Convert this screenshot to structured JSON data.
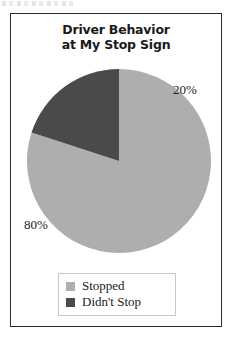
{
  "chart_data": {
    "type": "pie",
    "title": "Driver Behavior at My Stop Sign",
    "title_lines": [
      "Driver Behavior",
      "at My Stop Sign"
    ],
    "categories": [
      "Stopped",
      "Didn't Stop"
    ],
    "values": [
      80,
      20
    ],
    "value_labels": [
      "80%",
      "20%"
    ],
    "unit": "%",
    "colors": [
      "#aeaeae",
      "#4a4a4a"
    ],
    "legend_position": "bottom",
    "start_angle_deg": 0,
    "direction": "clockwise",
    "xlabel": "",
    "ylabel": "",
    "grid": false,
    "slices": [
      {
        "label": "Stopped",
        "value": 80,
        "display": "80%",
        "color": "#aeaeae"
      },
      {
        "label": "Didn't Stop",
        "value": 20,
        "display": "20%",
        "color": "#4a4a4a"
      }
    ]
  },
  "legend": {
    "items": [
      {
        "label": "Stopped",
        "color": "#aeaeae"
      },
      {
        "label": "Didn't Stop",
        "color": "#4a4a4a"
      }
    ]
  },
  "colors": {
    "stopped": "#aeaeae",
    "didnt_stop": "#4a4a4a",
    "border": "#2b2b2b",
    "text": "#1a1a1a"
  }
}
